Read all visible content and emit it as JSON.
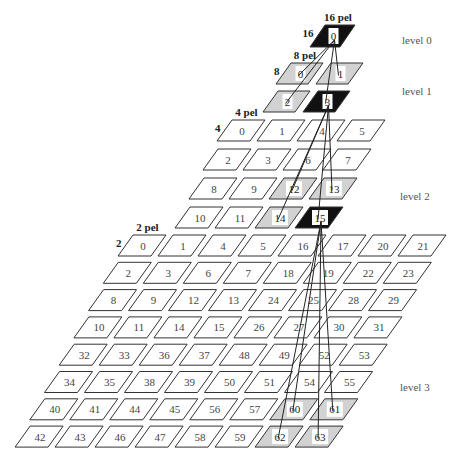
{
  "levels": [
    {
      "name": "level 0",
      "label_pos": [
        402,
        44
      ],
      "block_size_label": "16 pel",
      "side_label": "16",
      "grid": {
        "rows": 1,
        "cols": 1,
        "x0": 325,
        "y0": 25,
        "dx": 40,
        "rx": -15,
        "ry": 28,
        "w": 30,
        "h": 22,
        "slant": 15
      },
      "tiles": [
        [
          0
        ]
      ],
      "styles": {
        "0": "black"
      }
    },
    {
      "name": "level 1",
      "label_pos": [
        402,
        95
      ],
      "block_size_label": "8 pel",
      "side_label": "8",
      "grid": {
        "rows": 2,
        "cols": 2,
        "x0": 291,
        "y0": 63,
        "dx": 40,
        "rx": -13,
        "ry": 28,
        "w": 32,
        "h": 21,
        "slant": 15
      },
      "tiles": [
        [
          0,
          1
        ],
        [
          2,
          3
        ]
      ],
      "styles": {
        "0": "gray",
        "1": "gray",
        "2": "gray",
        "3": "black"
      }
    },
    {
      "name": "level 2",
      "label_pos": [
        400,
        200
      ],
      "block_size_label": "4 pel",
      "side_label": "4",
      "grid": {
        "rows": 4,
        "cols": 4,
        "x0": 232,
        "y0": 120,
        "dx": 40,
        "rx": -14,
        "ry": 29,
        "w": 33,
        "h": 21,
        "slant": 15
      },
      "tiles": [
        [
          0,
          1,
          4,
          5
        ],
        [
          2,
          3,
          6,
          7
        ],
        [
          8,
          9,
          12,
          13
        ],
        [
          10,
          11,
          14,
          15
        ]
      ],
      "styles": {
        "12": "gray",
        "13": "gray",
        "14": "gray",
        "15": "black"
      }
    },
    {
      "name": "level 3",
      "label_pos": [
        400,
        391
      ],
      "block_size_label": "2 pel",
      "side_label": "2",
      "grid": {
        "rows": 8,
        "cols": 8,
        "x0": 133,
        "y0": 235,
        "dx": 40,
        "rx": -14.7,
        "ry": 27.3,
        "w": 33,
        "h": 21,
        "slant": 15
      },
      "tiles": [
        [
          0,
          1,
          4,
          5,
          16,
          17,
          20,
          21
        ],
        [
          2,
          3,
          6,
          7,
          18,
          19,
          22,
          23
        ],
        [
          8,
          9,
          12,
          13,
          24,
          25,
          28,
          29
        ],
        [
          10,
          11,
          14,
          15,
          26,
          27,
          30,
          31
        ],
        [
          32,
          33,
          36,
          37,
          48,
          49,
          52,
          53
        ],
        [
          34,
          35,
          38,
          39,
          50,
          51,
          54,
          55
        ],
        [
          40,
          41,
          44,
          45,
          56,
          57,
          60,
          61
        ],
        [
          42,
          43,
          46,
          47,
          58,
          59,
          62,
          63
        ]
      ],
      "styles": {
        "60": "gray",
        "61": "gray",
        "62": "gray",
        "63": "black-outline-gray"
      }
    }
  ],
  "links": [
    {
      "from_level": 0,
      "from_tile": 0,
      "to_level": 1,
      "to_tiles": [
        0,
        1,
        2,
        3
      ]
    },
    {
      "from_level": 1,
      "from_tile": 3,
      "to_level": 2,
      "to_tiles": [
        12,
        13,
        14,
        15
      ]
    },
    {
      "from_level": 2,
      "from_tile": 15,
      "to_level": 3,
      "to_tiles": [
        60,
        61,
        62,
        63
      ]
    }
  ],
  "colors": {
    "white": "#ffffff",
    "gray": "#d2d2d2",
    "black": "#111111",
    "stroke": "#333333"
  }
}
